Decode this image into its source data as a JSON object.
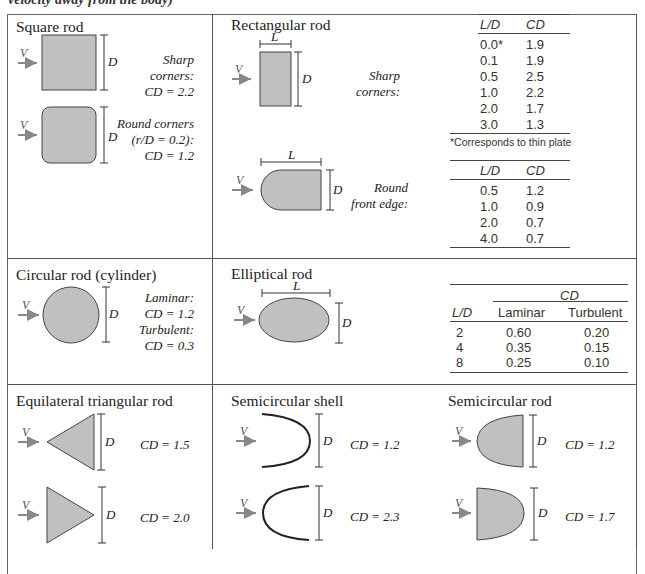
{
  "caption_fragment": "velocity away from the body)",
  "colors": {
    "shape_fill": "#c0c0c0",
    "arrow": "#888888",
    "border": "#555555"
  },
  "symbols": {
    "velocity": "V",
    "diameter": "D",
    "length": "L",
    "cd_label": "C_D"
  },
  "cells": {
    "square_rod": {
      "title": "Square rod",
      "sharp_label": "Sharp corners:",
      "sharp_cd": "CD = 2.2",
      "round_label_1": "Round corners",
      "round_label_2": "(r/D = 0.2):",
      "round_cd": "CD = 1.2"
    },
    "rectangular_rod": {
      "title": "Rectangular rod",
      "sharp_label_1": "Sharp",
      "sharp_label_2": "corners:",
      "round_label_1": "Round",
      "round_label_2": "front edge:",
      "sharp_table": {
        "headers": [
          "L/D",
          "CD"
        ],
        "rows": [
          [
            "0.0*",
            "1.9"
          ],
          [
            "0.1",
            "1.9"
          ],
          [
            "0.5",
            "2.5"
          ],
          [
            "1.0",
            "2.2"
          ],
          [
            "2.0",
            "1.7"
          ],
          [
            "3.0",
            "1.3"
          ]
        ],
        "footnote": "*Corresponds to thin plate"
      },
      "round_table": {
        "headers": [
          "L/D",
          "CD"
        ],
        "rows": [
          [
            "0.5",
            "1.2"
          ],
          [
            "1.0",
            "0.9"
          ],
          [
            "2.0",
            "0.7"
          ],
          [
            "4.0",
            "0.7"
          ]
        ]
      }
    },
    "circular_rod": {
      "title": "Circular rod (cylinder)",
      "laminar_label": "Laminar:",
      "laminar_cd": "CD = 1.2",
      "turbulent_label": "Turbulent:",
      "turbulent_cd": "CD = 0.3"
    },
    "elliptical_rod": {
      "title": "Elliptical rod",
      "table": {
        "group_header": "CD",
        "headers": [
          "L/D",
          "Laminar",
          "Turbulent"
        ],
        "rows": [
          [
            "2",
            "0.60",
            "0.20"
          ],
          [
            "4",
            "0.35",
            "0.15"
          ],
          [
            "8",
            "0.25",
            "0.10"
          ]
        ]
      }
    },
    "triangular_rod": {
      "title": "Equilateral triangular rod",
      "cd_1": "CD = 1.5",
      "cd_2": "CD = 2.0"
    },
    "semicircular_shell": {
      "title": "Semicircular shell",
      "cd_1": "CD = 1.2",
      "cd_2": "CD = 2.3"
    },
    "semicircular_rod": {
      "title": "Semicircular rod",
      "cd_1": "CD = 1.2",
      "cd_2": "CD = 1.7"
    }
  }
}
